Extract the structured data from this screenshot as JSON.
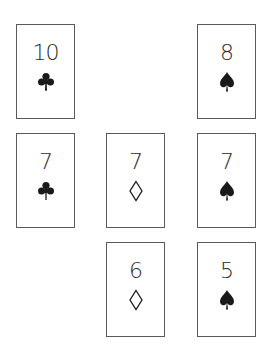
{
  "layout": {
    "columns_x": [
      16,
      106,
      197
    ],
    "rows_y": [
      24,
      133,
      242
    ]
  },
  "colors": {
    "border": "#5a5a5a",
    "ink": "#1a1a1a",
    "background": "#ffffff"
  },
  "cards": [
    {
      "rank": "10",
      "suit": "clubs",
      "suit_glyph": "club-icon",
      "row": 0,
      "col": 0
    },
    {
      "rank": "8",
      "suit": "spades",
      "suit_glyph": "spade-icon",
      "row": 0,
      "col": 2
    },
    {
      "rank": "7",
      "suit": "clubs",
      "suit_glyph": "club-icon",
      "row": 1,
      "col": 0
    },
    {
      "rank": "7",
      "suit": "diamonds",
      "suit_glyph": "diamond-icon",
      "row": 1,
      "col": 1
    },
    {
      "rank": "7",
      "suit": "spades",
      "suit_glyph": "spade-icon",
      "row": 1,
      "col": 2
    },
    {
      "rank": "6",
      "suit": "diamonds",
      "suit_glyph": "diamond-icon",
      "row": 2,
      "col": 1
    },
    {
      "rank": "5",
      "suit": "spades",
      "suit_glyph": "spade-icon",
      "row": 2,
      "col": 2
    }
  ]
}
